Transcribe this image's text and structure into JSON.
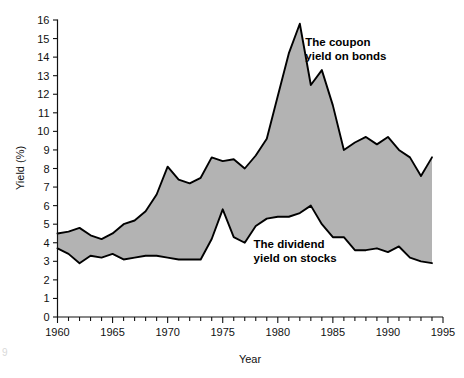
{
  "chart_data": {
    "type": "area",
    "title": "",
    "xlabel": "Year",
    "ylabel": "Yield (%)",
    "xlim": [
      1960,
      1995
    ],
    "ylim": [
      0,
      16
    ],
    "xticks": [
      1960,
      1965,
      1970,
      1975,
      1980,
      1985,
      1990,
      1995
    ],
    "xtick_labels": [
      "1960",
      "1965",
      "1970",
      "1975",
      "1980",
      "1985",
      "1990",
      "1995"
    ],
    "x_minor_tick_step": 1,
    "yticks": [
      0,
      1,
      2,
      3,
      4,
      5,
      6,
      7,
      8,
      9,
      10,
      11,
      12,
      13,
      14,
      15,
      16
    ],
    "ytick_labels": [
      "0",
      "1",
      "2",
      "3",
      "4",
      "5",
      "6",
      "7",
      "8",
      "9",
      "10",
      "11",
      "12",
      "13",
      "14",
      "15",
      "16"
    ],
    "grid": false,
    "legend_position": "inline-annotations",
    "fill_color": "#b3b3b3",
    "line_color": "#000000",
    "background_color": "#ffffff",
    "x": [
      1960,
      1961,
      1962,
      1963,
      1964,
      1965,
      1966,
      1967,
      1968,
      1969,
      1970,
      1971,
      1972,
      1973,
      1974,
      1975,
      1976,
      1977,
      1978,
      1979,
      1980,
      1981,
      1982,
      1983,
      1984,
      1985,
      1986,
      1987,
      1988,
      1989,
      1990,
      1991,
      1992,
      1993,
      1994
    ],
    "series": [
      {
        "name": "The coupon yield on bonds",
        "values": [
          4.5,
          4.6,
          4.8,
          4.4,
          4.2,
          4.5,
          5.0,
          5.2,
          5.7,
          6.6,
          8.1,
          7.4,
          7.2,
          7.5,
          8.6,
          8.4,
          8.5,
          8.0,
          8.7,
          9.6,
          11.9,
          14.2,
          15.8,
          12.5,
          13.3,
          11.4,
          9.0,
          9.4,
          9.7,
          9.3,
          9.7,
          9.0,
          8.6,
          7.6,
          8.6
        ]
      },
      {
        "name": "The dividend yield on stocks",
        "values": [
          3.7,
          3.4,
          2.9,
          3.3,
          3.2,
          3.4,
          3.1,
          3.2,
          3.3,
          3.3,
          3.2,
          3.1,
          3.1,
          3.1,
          4.2,
          5.8,
          4.3,
          4.0,
          4.9,
          5.3,
          5.4,
          5.4,
          5.6,
          6.0,
          5.0,
          4.3,
          4.3,
          3.6,
          3.6,
          3.7,
          3.5,
          3.8,
          3.2,
          3.0,
          2.9
        ]
      }
    ],
    "annotations": [
      {
        "id": "bonds-annotation",
        "lines": [
          "The coupon",
          "yield on bonds"
        ],
        "x": 1982.5,
        "y": 14.6
      },
      {
        "id": "stocks-annotation",
        "lines": [
          "The dividend",
          "yield on stocks"
        ],
        "x": 1977.8,
        "y": 3.7
      }
    ]
  },
  "corner": {
    "mark": "9"
  }
}
